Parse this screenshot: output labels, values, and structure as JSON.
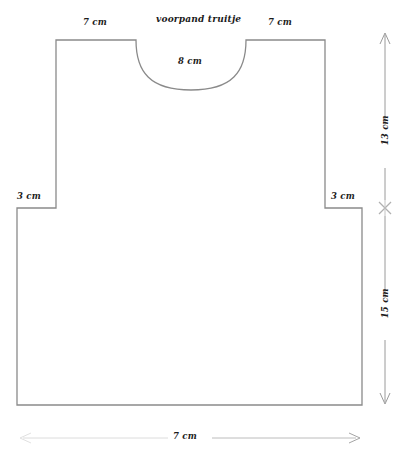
{
  "diagram": {
    "title": "voorpand truitje",
    "type": "sewing-pattern-front-panel",
    "line_color": "#8a8a8a",
    "text_color": "#1b1b1b",
    "background": "#ffffff",
    "measurements": {
      "shoulder_left": "7 cm",
      "shoulder_right": "7 cm",
      "neck_width": "8 cm",
      "sleeve_left": "3 cm",
      "sleeve_right": "3 cm",
      "upper_height": "13 cm",
      "lower_height": "15 cm",
      "body_width": "7 cm"
    },
    "shape": {
      "top_y": 40,
      "bottom_y": 405,
      "body_left_x": 17,
      "body_right_x": 362,
      "shoulder_left_x": 56,
      "shoulder_right_x": 325,
      "neck_left_x": 136,
      "neck_right_x": 246,
      "neck_depth_y": 84,
      "sleeve_step_y": 208
    },
    "dimension_lines": {
      "vertical_x": 385,
      "vertical_top_y": 33,
      "vertical_mid_y": 208,
      "vertical_bottom_y": 404,
      "vertical_mid_marker": "x-marker",
      "horizontal_y": 438,
      "horizontal_left_x": 14,
      "horizontal_right_x": 360
    }
  }
}
